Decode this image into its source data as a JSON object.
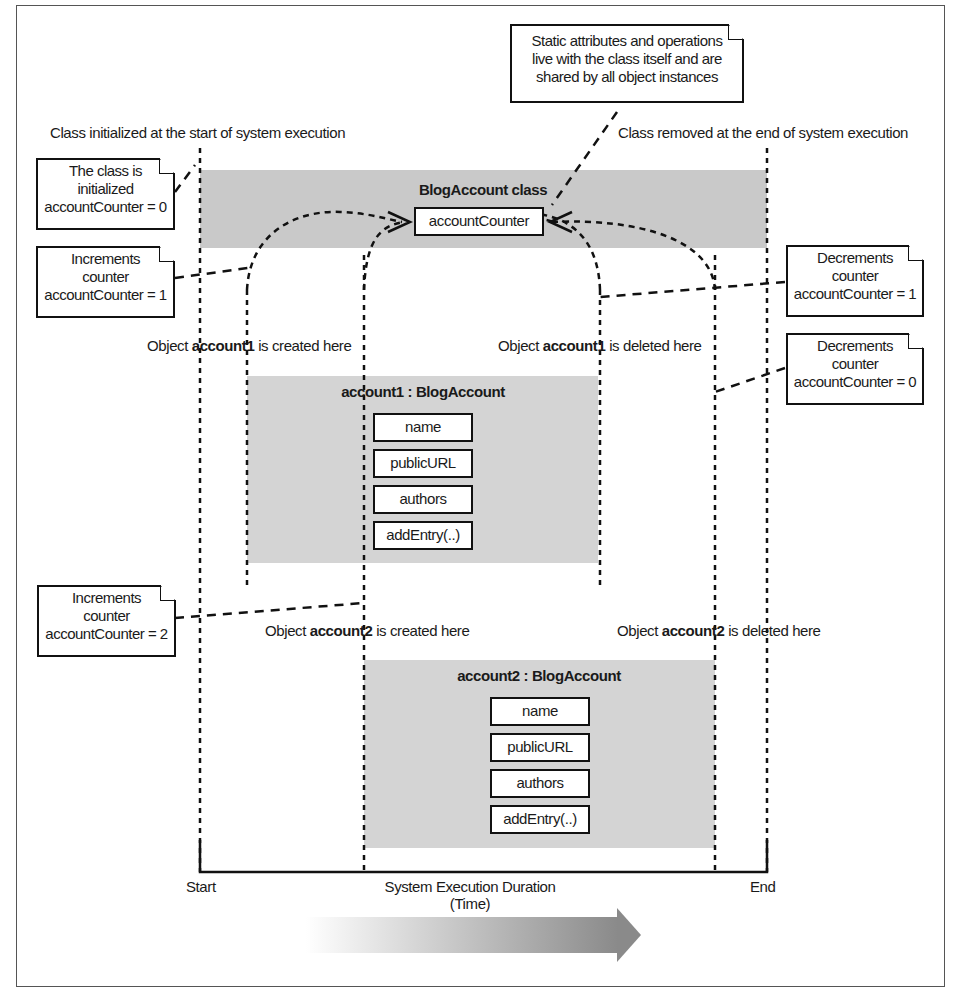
{
  "diagram": {
    "class_band": {
      "title": "BlogAccount class",
      "static_attribute": "accountCounter"
    },
    "account1": {
      "title": "account1 : BlogAccount",
      "members": [
        "name",
        "publicURL",
        "authors",
        "addEntry(..)"
      ]
    },
    "account2": {
      "title": "account2 : BlogAccount",
      "members": [
        "name",
        "publicURL",
        "authors",
        "addEntry(..)"
      ]
    },
    "labels": {
      "class_initialized": "Class initialized at the start of system execution",
      "class_removed": "Class removed at the end of system execution",
      "account1_created_prefix": "Object ",
      "account1_created_bold": "account1",
      "account1_created_suffix": " is created here",
      "account1_deleted_prefix": "Object ",
      "account1_deleted_bold": "account1",
      "account1_deleted_suffix": " is deleted here",
      "account2_created_prefix": "Object ",
      "account2_created_bold": "account2",
      "account2_created_suffix": " is created here",
      "account2_deleted_prefix": "Object ",
      "account2_deleted_bold": "account2",
      "account2_deleted_suffix": " is deleted here"
    },
    "notes": {
      "static_note": [
        "Static attributes and operations",
        "live with the class itself and are",
        "shared by all object instances"
      ],
      "init_note": [
        "The class is",
        "initialized",
        "accountCounter = 0"
      ],
      "inc1_note": [
        "Increments",
        "counter",
        "accountCounter = 1"
      ],
      "inc2_note": [
        "Increments",
        "counter",
        "accountCounter = 2"
      ],
      "dec1_note": [
        "Decrements",
        "counter",
        "accountCounter = 1"
      ],
      "dec0_note": [
        "Decrements",
        "counter",
        "accountCounter = 0"
      ]
    },
    "timeline": {
      "start": "Start",
      "end": "End",
      "axis_label_line1": "System Execution Duration",
      "axis_label_line2": "(Time)"
    },
    "colors": {
      "class_band": "#c9c9c9",
      "object_band": "#d4d4d4",
      "line": "#111111"
    }
  }
}
